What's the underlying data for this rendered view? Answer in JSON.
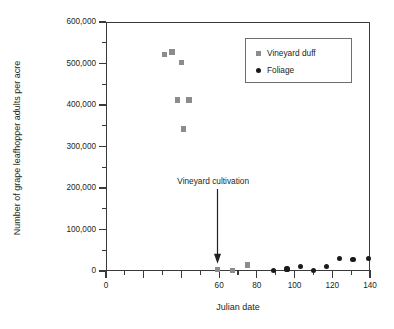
{
  "chart_data": {
    "type": "scatter",
    "title": "",
    "xlabel": "Julian date",
    "ylabel": "Number of grape leafhopper adults per acre",
    "xlim": [
      0,
      140
    ],
    "ylim": [
      0,
      600000
    ],
    "grid": false,
    "x_ticks": [
      0,
      20,
      40,
      60,
      80,
      100,
      120,
      140
    ],
    "x_tick_labels": [
      "0",
      "20",
      "40",
      "60",
      "80",
      "100",
      "120",
      "140"
    ],
    "x_tick_labels_shown": [
      "0",
      "",
      "",
      "60",
      "80",
      "100",
      "120",
      "140"
    ],
    "x_minor_ticks": [
      10,
      30,
      50,
      70,
      90,
      110,
      130
    ],
    "y_ticks": [
      0,
      100000,
      200000,
      300000,
      400000,
      500000,
      600000
    ],
    "y_tick_labels": [
      "0",
      "100,000",
      "200,000",
      "300,000",
      "400,000",
      "500,000",
      "600,000"
    ],
    "y_minor_ticks": [
      50000,
      150000,
      250000,
      350000,
      450000,
      550000
    ],
    "legend_position": "top-right",
    "series": [
      {
        "name": "Vineyard duff",
        "marker": "square",
        "color": "#8c8c8c",
        "points": [
          {
            "x": 31,
            "y": 522000
          },
          {
            "x": 35,
            "y": 528000
          },
          {
            "x": 40,
            "y": 502000
          },
          {
            "x": 38,
            "y": 412000
          },
          {
            "x": 44,
            "y": 412000
          },
          {
            "x": 41,
            "y": 342000
          },
          {
            "x": 59,
            "y": 3000
          },
          {
            "x": 67,
            "y": 1000
          },
          {
            "x": 75,
            "y": 14000
          }
        ]
      },
      {
        "name": "Foliage",
        "marker": "circle",
        "color": "#1a1a1a",
        "points": [
          {
            "x": 89,
            "y": 1000
          },
          {
            "x": 96,
            "y": 5000
          },
          {
            "x": 103,
            "y": 10000
          },
          {
            "x": 110,
            "y": 2000
          },
          {
            "x": 117,
            "y": 10000
          },
          {
            "x": 124,
            "y": 31000
          },
          {
            "x": 131,
            "y": 28000
          },
          {
            "x": 139,
            "y": 31000
          }
        ]
      }
    ],
    "annotations": [
      {
        "text": "Vineyard cultivation",
        "x": 59,
        "y_text": 215000,
        "y_tip": 18000,
        "arrow": "down"
      }
    ]
  },
  "legend": {
    "entries": [
      {
        "label": "Vineyard duff",
        "marker": "square"
      },
      {
        "label": "Foliage",
        "marker": "circle"
      }
    ]
  }
}
